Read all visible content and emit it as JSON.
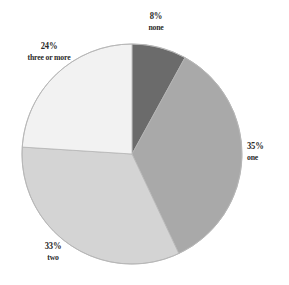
{
  "chart_data": {
    "type": "pie",
    "title": "",
    "subtitle": "",
    "xlabel": "",
    "ylabel": "",
    "legend_position": "none",
    "grid": false,
    "value_unit": "%",
    "start_angle_deg": 0,
    "direction": "clockwise",
    "center": {
      "x": 132,
      "y": 154
    },
    "radius": 110,
    "categories": [
      "none",
      "one",
      "two",
      "three or more"
    ],
    "values": [
      8,
      35,
      33,
      24
    ],
    "labels": [
      "8%",
      "35%",
      "33%",
      "24%"
    ],
    "colors": [
      "#6b6b6b",
      "#a9a9a9",
      "#d4d4d4",
      "#f2f2f2"
    ],
    "slices": [
      {
        "category": "none",
        "value": 8,
        "percent_label": "8%",
        "color": "#6b6b6b",
        "start_deg": 0,
        "end_deg": 28.8
      },
      {
        "category": "one",
        "value": 35,
        "percent_label": "35%",
        "color": "#a9a9a9",
        "start_deg": 28.8,
        "end_deg": 154.8
      },
      {
        "category": "two",
        "value": 33,
        "percent_label": "33%",
        "color": "#d4d4d4",
        "start_deg": 154.8,
        "end_deg": 273.6
      },
      {
        "category": "three or more",
        "value": 24,
        "percent_label": "24%",
        "color": "#f2f2f2",
        "start_deg": 273.6,
        "end_deg": 360
      }
    ]
  },
  "style": {
    "background": "#ffffff",
    "label_color": "#2b2b2b",
    "outline_color": "#b5b5b5"
  }
}
